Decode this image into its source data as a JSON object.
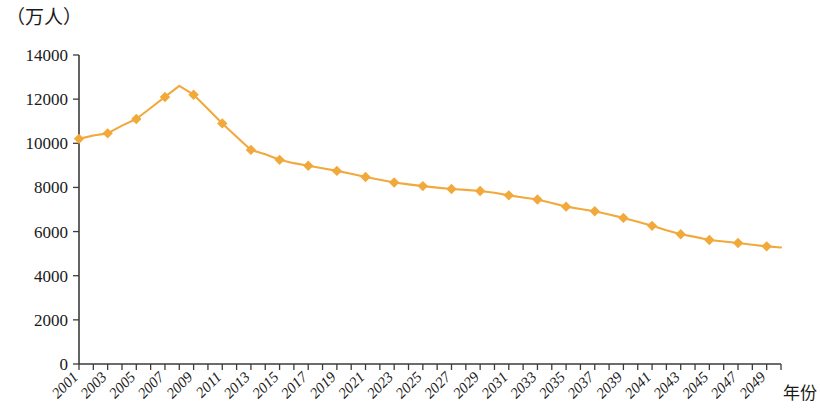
{
  "chart_data": {
    "type": "line",
    "title": "",
    "subtitle": "",
    "ylabel": "（万人）",
    "xlabel": "年份",
    "ylim": [
      0,
      14000
    ],
    "xlim": [
      2001,
      2050
    ],
    "grid": false,
    "legend": null,
    "series_color": "#F2A93B",
    "marker": "diamond",
    "marker_interval_years": 2,
    "y_ticks": [
      0,
      2000,
      4000,
      6000,
      8000,
      10000,
      12000,
      14000
    ],
    "y_tick_labels": [
      "0",
      "2000",
      "4000",
      "6000",
      "8000",
      "10000",
      "12000",
      "14000"
    ],
    "x_tick_labels": [
      "2001",
      "2003",
      "2005",
      "2007",
      "2009",
      "2011",
      "2013",
      "2015",
      "2017",
      "2019",
      "2021",
      "2023",
      "2025",
      "2027",
      "2029",
      "2031",
      "2033",
      "2035",
      "2037",
      "2039",
      "2041",
      "2043",
      "2045",
      "2047",
      "2049"
    ],
    "x": [
      2001,
      2002,
      2003,
      2004,
      2005,
      2006,
      2007,
      2008,
      2009,
      2010,
      2011,
      2012,
      2013,
      2014,
      2015,
      2016,
      2017,
      2018,
      2019,
      2020,
      2021,
      2022,
      2023,
      2024,
      2025,
      2026,
      2027,
      2028,
      2029,
      2030,
      2031,
      2032,
      2033,
      2034,
      2035,
      2036,
      2037,
      2038,
      2039,
      2040,
      2041,
      2042,
      2043,
      2044,
      2045,
      2046,
      2047,
      2048,
      2049,
      2050
    ],
    "values": [
      10200,
      10350,
      10450,
      10800,
      11100,
      11600,
      12100,
      12600,
      12200,
      11550,
      10900,
      10300,
      9700,
      9500,
      9250,
      9100,
      8980,
      8870,
      8750,
      8620,
      8470,
      8350,
      8220,
      8140,
      8060,
      7990,
      7930,
      7890,
      7840,
      7760,
      7640,
      7540,
      7450,
      7290,
      7130,
      7020,
      6920,
      6770,
      6620,
      6440,
      6260,
      6060,
      5880,
      5760,
      5620,
      5550,
      5480,
      5400,
      5330,
      5280
    ],
    "annotations": []
  }
}
